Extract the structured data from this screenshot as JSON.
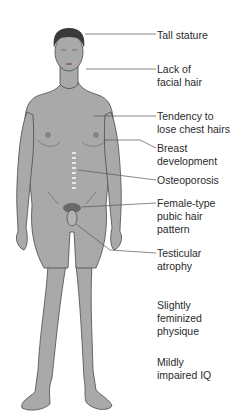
{
  "diagram": {
    "colors": {
      "skin": "#a9a9a9",
      "outline": "#4a4a4a",
      "hair": "#3a3a3a",
      "leader_line": "#555555",
      "text": "#2a2a2a"
    },
    "labels": [
      {
        "id": "tall-stature",
        "text": "Tall stature",
        "top": 29
      },
      {
        "id": "facial-hair",
        "text": "Lack of\nfacial hair",
        "top": 63
      },
      {
        "id": "chest-hairs",
        "text": "Tendency to\nlose chest hairs",
        "top": 110
      },
      {
        "id": "breast",
        "text": "Breast\ndevelopment",
        "top": 142
      },
      {
        "id": "osteoporosis",
        "text": "Osteoporosis",
        "top": 174
      },
      {
        "id": "pubic-hair",
        "text": "Female-type\npubic hair\npattern",
        "top": 197
      },
      {
        "id": "testicular",
        "text": "Testicular\natrophy",
        "top": 247
      },
      {
        "id": "physique",
        "text": "Slightly\nfeminized\nphysique",
        "top": 299
      },
      {
        "id": "iq",
        "text": "Mildly\nimpaired IQ",
        "top": 356
      }
    ]
  }
}
